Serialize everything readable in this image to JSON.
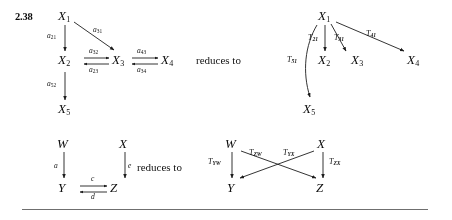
{
  "page": {
    "exercise_number": "2.38",
    "reduces_to_label": "reduces to",
    "rule_color": "#6f6f6f",
    "ink_color": "#1f1f1f",
    "background": "#ffffff"
  },
  "diagram_top_left": {
    "name": "original-chain-diagram",
    "nodes": [
      {
        "id": "x1",
        "base": "X",
        "sub": "1"
      },
      {
        "id": "x2",
        "base": "X",
        "sub": "2"
      },
      {
        "id": "x3",
        "base": "X",
        "sub": "3"
      },
      {
        "id": "x4",
        "base": "X",
        "sub": "4"
      },
      {
        "id": "x5",
        "base": "X",
        "sub": "5"
      }
    ],
    "edges": [
      {
        "id": "a21",
        "base": "a",
        "sub": "21",
        "from": "x1",
        "to": "x2"
      },
      {
        "id": "a31",
        "base": "a",
        "sub": "31",
        "from": "x1",
        "to": "x3"
      },
      {
        "id": "a32",
        "base": "a",
        "sub": "32",
        "from": "x2",
        "to": "x3"
      },
      {
        "id": "a23",
        "base": "a",
        "sub": "23",
        "from": "x3",
        "to": "x2"
      },
      {
        "id": "a43",
        "base": "a",
        "sub": "43",
        "from": "x3",
        "to": "x4"
      },
      {
        "id": "a34",
        "base": "a",
        "sub": "34",
        "from": "x4",
        "to": "x3"
      },
      {
        "id": "a52",
        "base": "a",
        "sub": "52",
        "from": "x2",
        "to": "x5"
      }
    ]
  },
  "diagram_top_right": {
    "name": "reduced-star-diagram",
    "nodes": [
      {
        "id": "x1",
        "base": "X",
        "sub": "1"
      },
      {
        "id": "x2",
        "base": "X",
        "sub": "2"
      },
      {
        "id": "x3",
        "base": "X",
        "sub": "3"
      },
      {
        "id": "x4",
        "base": "X",
        "sub": "4"
      },
      {
        "id": "x5",
        "base": "X",
        "sub": "5"
      }
    ],
    "edges": [
      {
        "id": "t21",
        "base": "T",
        "sub": "21",
        "from": "x1",
        "to": "x2"
      },
      {
        "id": "t31",
        "base": "T",
        "sub": "31",
        "from": "x1",
        "to": "x3"
      },
      {
        "id": "t41",
        "base": "T",
        "sub": "41",
        "from": "x1",
        "to": "x4"
      },
      {
        "id": "t51",
        "base": "T",
        "sub": "51",
        "from": "x1",
        "to": "x5"
      }
    ]
  },
  "diagram_bottom_left": {
    "name": "original-square-diagram",
    "nodes": [
      {
        "id": "w",
        "base": "W"
      },
      {
        "id": "x",
        "base": "X"
      },
      {
        "id": "y",
        "base": "Y"
      },
      {
        "id": "z",
        "base": "Z"
      }
    ],
    "edges": [
      {
        "id": "a",
        "base": "a",
        "from": "w",
        "to": "y"
      },
      {
        "id": "e",
        "base": "e",
        "from": "x",
        "to": "z"
      },
      {
        "id": "c",
        "base": "c",
        "from": "y",
        "to": "z"
      },
      {
        "id": "d",
        "base": "d",
        "from": "z",
        "to": "y"
      }
    ]
  },
  "diagram_bottom_right": {
    "name": "reduced-crossed-diagram",
    "nodes": [
      {
        "id": "w",
        "base": "W"
      },
      {
        "id": "x",
        "base": "X"
      },
      {
        "id": "y",
        "base": "Y"
      },
      {
        "id": "z",
        "base": "Z"
      }
    ],
    "edges": [
      {
        "id": "tyw",
        "base": "T",
        "sub": "YW",
        "from": "w",
        "to": "y"
      },
      {
        "id": "tzw",
        "base": "T",
        "sub": "ZW",
        "from": "w",
        "to": "z"
      },
      {
        "id": "tyx",
        "base": "T",
        "sub": "YX",
        "from": "x",
        "to": "y"
      },
      {
        "id": "tzx",
        "base": "T",
        "sub": "ZX",
        "from": "x",
        "to": "z"
      }
    ]
  }
}
